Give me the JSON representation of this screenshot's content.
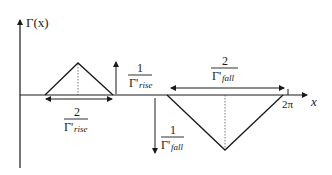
{
  "figure": {
    "y_axis_label": "Γ(x)",
    "x_axis_label": "x",
    "x_tick_label": "2π",
    "rise": {
      "height_label": {
        "numerator": "1",
        "denominator_symbol": "Γ'",
        "denominator_sub": "rise"
      },
      "width_label": {
        "numerator": "2",
        "denominator_symbol": "Γ'",
        "denominator_sub": "rise"
      }
    },
    "fall": {
      "height_label": {
        "numerator": "1",
        "denominator_symbol": "Γ'",
        "denominator_sub": "fall"
      },
      "width_label": {
        "numerator": "2",
        "denominator_symbol": "Γ'",
        "denominator_sub": "fall"
      }
    },
    "colors": {
      "line": "#1a1a1a",
      "dotted": "#555555",
      "background": "#ffffff"
    }
  }
}
